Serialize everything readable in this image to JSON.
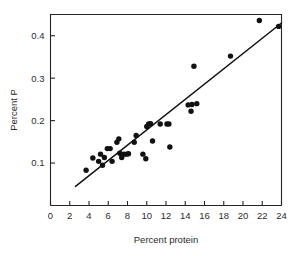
{
  "chart_data": {
    "type": "scatter",
    "title": "",
    "subtitle": "",
    "xlabel": "Percent protein",
    "ylabel": "Percent P",
    "xlim": [
      0,
      24
    ],
    "ylim": [
      0,
      0.45
    ],
    "xticks": [
      0,
      2,
      4,
      6,
      8,
      10,
      12,
      14,
      16,
      18,
      20,
      22,
      24
    ],
    "xtick_labels": [
      "0",
      "2",
      "4",
      "6",
      "8",
      "10",
      "12",
      "14",
      "16",
      "18",
      "20",
      "22",
      "24"
    ],
    "yticks": [
      0.1,
      0.2,
      0.3,
      0.4
    ],
    "ytick_labels": [
      "0.1",
      "0.2",
      "0.3",
      "0.4"
    ],
    "grid": false,
    "legend": null,
    "marker": "filled-circle",
    "marker_color": "#111111",
    "series": [
      {
        "name": "observations",
        "points": [
          [
            3.7,
            0.083
          ],
          [
            4.4,
            0.112
          ],
          [
            5.0,
            0.104
          ],
          [
            5.2,
            0.121
          ],
          [
            5.4,
            0.095
          ],
          [
            5.6,
            0.113
          ],
          [
            5.9,
            0.134
          ],
          [
            6.2,
            0.134
          ],
          [
            6.4,
            0.104
          ],
          [
            6.9,
            0.149
          ],
          [
            7.1,
            0.157
          ],
          [
            7.2,
            0.123
          ],
          [
            7.4,
            0.113
          ],
          [
            7.6,
            0.121
          ],
          [
            7.9,
            0.121
          ],
          [
            8.1,
            0.122
          ],
          [
            8.7,
            0.149
          ],
          [
            8.9,
            0.165
          ],
          [
            9.6,
            0.121
          ],
          [
            9.9,
            0.11
          ],
          [
            10.0,
            0.186
          ],
          [
            10.2,
            0.192
          ],
          [
            10.4,
            0.193
          ],
          [
            10.6,
            0.152
          ],
          [
            11.4,
            0.192
          ],
          [
            12.1,
            0.192
          ],
          [
            12.3,
            0.192
          ],
          [
            12.4,
            0.138
          ],
          [
            14.3,
            0.237
          ],
          [
            14.6,
            0.222
          ],
          [
            14.7,
            0.238
          ],
          [
            14.9,
            0.328
          ],
          [
            15.2,
            0.24
          ],
          [
            18.7,
            0.352
          ],
          [
            21.7,
            0.436
          ],
          [
            23.7,
            0.422
          ]
        ]
      }
    ],
    "fit_line": {
      "name": "regression-line",
      "x_start": 2.6,
      "y_start": 0.045,
      "x_end": 24.0,
      "y_end": 0.43,
      "color": "#111111"
    }
  },
  "axes": {
    "x_title": "Percent protein",
    "y_title": "Percent P"
  }
}
